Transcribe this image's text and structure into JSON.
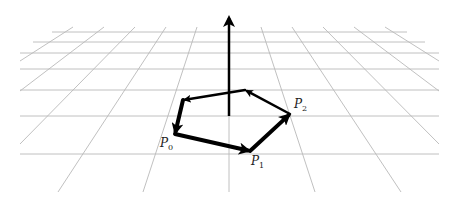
{
  "figure": {
    "colors": {
      "grid": "#b9b9b9",
      "ink": "#000000",
      "background": "#ffffff"
    },
    "grid": {
      "horizontal_y": [
        32,
        42,
        53,
        69,
        90,
        116,
        154
      ],
      "horizontal_x_ranges": [
        [
          52,
          407
        ],
        [
          33,
          425
        ],
        [
          20,
          439
        ],
        [
          20,
          439
        ],
        [
          20,
          439
        ],
        [
          20,
          439
        ],
        [
          20,
          439
        ]
      ],
      "converging_lines": [
        {
          "x1": 73,
          "y1": 27,
          "x2": 20,
          "y2": 61
        },
        {
          "x1": 104,
          "y1": 27,
          "x2": 20,
          "y2": 91
        },
        {
          "x1": 135,
          "y1": 27,
          "x2": 20,
          "y2": 144
        },
        {
          "x1": 166,
          "y1": 27,
          "x2": 58,
          "y2": 192
        },
        {
          "x1": 197,
          "y1": 27,
          "x2": 143,
          "y2": 192
        },
        {
          "x1": 229,
          "y1": 27,
          "x2": 229,
          "y2": 192
        },
        {
          "x1": 261,
          "y1": 27,
          "x2": 315,
          "y2": 192
        },
        {
          "x1": 292,
          "y1": 27,
          "x2": 401,
          "y2": 192
        },
        {
          "x1": 323,
          "y1": 27,
          "x2": 439,
          "y2": 144
        },
        {
          "x1": 354,
          "y1": 27,
          "x2": 439,
          "y2": 91
        },
        {
          "x1": 385,
          "y1": 27,
          "x2": 439,
          "y2": 61
        }
      ]
    },
    "normal_arrow": {
      "x": 229,
      "y_base": 116,
      "y_tip": 12
    },
    "polygon": {
      "vertices": [
        {
          "name": "P0",
          "x": 175,
          "y": 134
        },
        {
          "name": "P1",
          "x": 250,
          "y": 151
        },
        {
          "name": "P2",
          "x": 290,
          "y": 114
        },
        {
          "name": "",
          "x": 245,
          "y": 90
        },
        {
          "name": "",
          "x": 183,
          "y": 100
        }
      ],
      "edges": [
        {
          "from": 0,
          "to": 1,
          "width": 4
        },
        {
          "from": 1,
          "to": 2,
          "width": 4
        },
        {
          "from": 2,
          "to": 3,
          "width": 2.5
        },
        {
          "from": 3,
          "to": 4,
          "width": 2.5
        },
        {
          "from": 4,
          "to": 0,
          "width": 4
        }
      ]
    },
    "labels": [
      {
        "id": "p0",
        "base": "P",
        "sub": "0",
        "x": 160,
        "y": 147
      },
      {
        "id": "p1",
        "base": "P",
        "sub": "1",
        "x": 251,
        "y": 165
      },
      {
        "id": "p2",
        "base": "P",
        "sub": "2",
        "x": 294,
        "y": 108
      }
    ]
  }
}
